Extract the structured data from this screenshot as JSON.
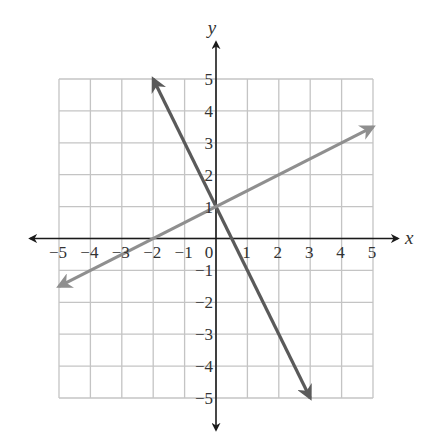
{
  "chart_data": {
    "type": "line",
    "title": "",
    "xlabel": "x",
    "ylabel": "y",
    "xlim": [
      -5,
      5
    ],
    "ylim": [
      -5,
      5
    ],
    "grid": true,
    "x_ticks": [
      -5,
      -4,
      -3,
      -2,
      -1,
      0,
      1,
      2,
      3,
      4,
      5
    ],
    "y_ticks": [
      -5,
      -4,
      -3,
      -2,
      -1,
      1,
      2,
      3,
      4,
      5
    ],
    "x_tick_labels": [
      "−5",
      "−4",
      "−3",
      "−2",
      "−1",
      "0",
      "1",
      "2",
      "3",
      "4",
      "5"
    ],
    "y_tick_labels": [
      "−5",
      "−4",
      "−3",
      "−2",
      "−1",
      "1",
      "2",
      "3",
      "4",
      "5"
    ],
    "series": [
      {
        "name": "line-steep",
        "equation": "y = -2x + 1",
        "slope": -2,
        "intercept": 1,
        "x": [
          -2,
          3
        ],
        "y": [
          5,
          -5
        ],
        "arrows": "both",
        "color": "#5a5a5a"
      },
      {
        "name": "line-shallow",
        "equation": "y = 0.5x + 1",
        "slope": 0.5,
        "intercept": 1,
        "x": [
          -5,
          5
        ],
        "y": [
          -1.5,
          3.5
        ],
        "arrows": "both",
        "color": "#8f8f8f"
      }
    ],
    "intersection": [
      0,
      1
    ]
  },
  "colors": {
    "grid": "#c4c4c4",
    "axes": "#1a1a1a",
    "text": "#333333"
  }
}
